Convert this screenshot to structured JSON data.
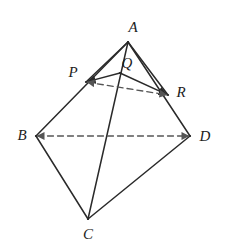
{
  "figure": {
    "type": "geometric-diagram",
    "background_color": "#ffffff",
    "stroke_color": "#2a2a2a",
    "dash_color": "#555555",
    "canvas": {
      "width": 226,
      "height": 250
    },
    "points": [
      {
        "id": "A",
        "label": "A",
        "x": 128,
        "y": 42,
        "label_x": 133,
        "label_y": 27
      },
      {
        "id": "B",
        "label": "B",
        "x": 36,
        "y": 136,
        "label_x": 22,
        "label_y": 135
      },
      {
        "id": "C",
        "label": "C",
        "x": 88,
        "y": 219,
        "label_x": 88,
        "label_y": 234
      },
      {
        "id": "D",
        "label": "D",
        "x": 190,
        "y": 136,
        "label_x": 205,
        "label_y": 136
      },
      {
        "id": "P",
        "label": "P",
        "x": 86,
        "y": 82,
        "label_x": 73,
        "label_y": 72
      },
      {
        "id": "Q",
        "label": "Q",
        "x": 120,
        "y": 73,
        "label_x": 127,
        "label_y": 63
      },
      {
        "id": "R",
        "label": "R",
        "x": 168,
        "y": 95,
        "label_x": 181,
        "label_y": 92
      }
    ],
    "segments": [
      {
        "id": "AB",
        "from": "A",
        "to": "B",
        "style": "solid",
        "arrow": "none"
      },
      {
        "id": "AD",
        "from": "A",
        "to": "D",
        "style": "solid",
        "arrow": "none"
      },
      {
        "id": "BC",
        "from": "B",
        "to": "C",
        "style": "solid",
        "arrow": "none"
      },
      {
        "id": "CD",
        "from": "C",
        "to": "D",
        "style": "solid",
        "arrow": "none"
      },
      {
        "id": "AC",
        "from": "A",
        "to": "C",
        "style": "solid",
        "arrow": "none"
      },
      {
        "id": "AP",
        "from": "A",
        "to": "P",
        "style": "solid",
        "arrow": "none"
      },
      {
        "id": "AR",
        "from": "A",
        "to": "R",
        "style": "solid",
        "arrow": "none"
      },
      {
        "id": "QP",
        "from": "Q",
        "to": "P",
        "style": "solid",
        "arrow": "end"
      },
      {
        "id": "QR",
        "from": "Q",
        "to": "R",
        "style": "solid",
        "arrow": "end"
      },
      {
        "id": "PR",
        "from": "P",
        "to": "R",
        "style": "dashed",
        "arrow": "both"
      },
      {
        "id": "BD",
        "from": "B",
        "to": "D",
        "style": "dashed",
        "arrow": "both"
      }
    ]
  }
}
